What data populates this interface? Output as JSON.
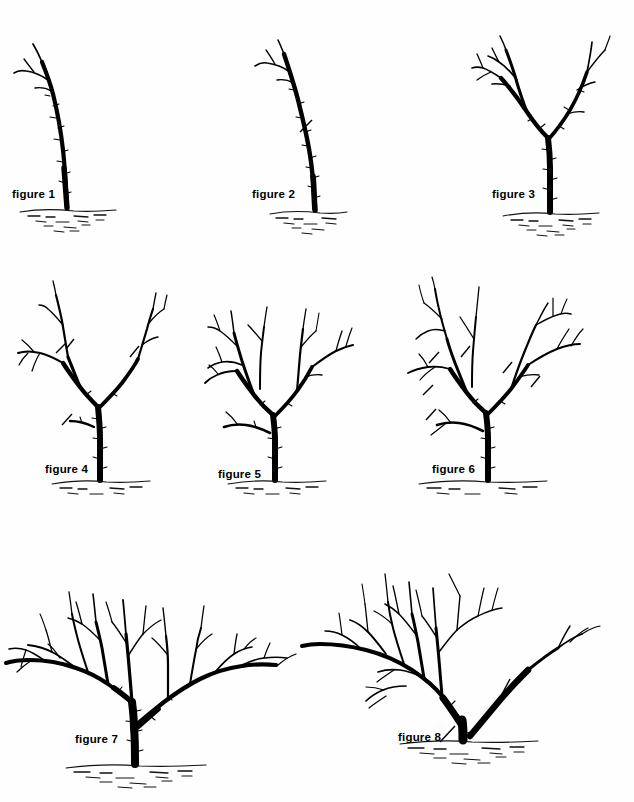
{
  "page": {
    "background_color": "#fefefe",
    "ink_color": "#000000",
    "width": 634,
    "height": 802,
    "row_count": 3,
    "figure_count": 8
  },
  "figures": [
    {
      "id": "figure-1",
      "label": "figure 1",
      "label_x": 12,
      "label_y": 188,
      "panel_x": 8,
      "panel_y": 28,
      "panel_w": 120,
      "panel_h": 210,
      "description": "Unbranched whip: single slightly curved leaning trunk with two small shoots near the top, planted in soil.",
      "stage": "unpruned whip at planting",
      "has_cut_marks": false,
      "cut_mark_count": 0,
      "scaffold_count": 0
    },
    {
      "id": "figure-2",
      "label": "figure 2",
      "label_x": 252,
      "label_y": 188,
      "panel_x": 228,
      "panel_y": 28,
      "panel_w": 120,
      "panel_h": 210,
      "description": "Same whip with a single diagonal heading-cut mark across the trunk part way up, indicating where to head back the leader.",
      "stage": "heading cut marked on whip",
      "has_cut_marks": true,
      "cut_mark_count": 1,
      "scaffold_count": 0
    },
    {
      "id": "figure-3",
      "label": "figure 3",
      "label_x": 492,
      "label_y": 188,
      "panel_x": 455,
      "panel_y": 28,
      "panel_w": 175,
      "panel_h": 210,
      "description": "One season later: trunk with two main scaffold limbs forming a wide V, each carrying several side shoots.",
      "stage": "first season regrowth, two scaffolds",
      "has_cut_marks": false,
      "cut_mark_count": 0,
      "scaffold_count": 2
    },
    {
      "id": "figure-4",
      "label": "figure 4",
      "label_x": 45,
      "label_y": 463,
      "panel_x": 8,
      "panel_y": 275,
      "panel_w": 175,
      "panel_h": 215,
      "description": "Young tree with three scaffold limbs and four diagonal cut marks showing which shoots to head back.",
      "stage": "dormant pruning cuts marked",
      "has_cut_marks": true,
      "cut_mark_count": 4,
      "scaffold_count": 3
    },
    {
      "id": "figure-5",
      "label": "figure 5",
      "label_x": 218,
      "label_y": 468,
      "panel_x": 190,
      "panel_y": 285,
      "panel_w": 175,
      "panel_h": 205,
      "description": "Tree after the cuts of figure 4 have regrown: denser, well balanced head of scaffold branches and laterals.",
      "stage": "second season regrowth",
      "has_cut_marks": false,
      "cut_mark_count": 0,
      "scaffold_count": 4
    },
    {
      "id": "figure-6",
      "label": "figure 6",
      "label_x": 432,
      "label_y": 463,
      "panel_x": 395,
      "panel_y": 275,
      "panel_w": 235,
      "panel_h": 215,
      "description": "Same tree as figure 5 with five diagonal cut marks on crowded and crossing limbs, indicating thinning cuts.",
      "stage": "thinning cuts marked",
      "has_cut_marks": true,
      "cut_mark_count": 5,
      "scaffold_count": 4
    },
    {
      "id": "figure-7",
      "label": "figure 7",
      "label_x": 75,
      "label_y": 733,
      "panel_x": 0,
      "panel_y": 552,
      "panel_w": 300,
      "panel_h": 240,
      "description": "Mature spreading tree with a low open-centre head: heavy scaffolds radiating left and right above a short trunk.",
      "stage": "mature bearing tree",
      "has_cut_marks": false,
      "cut_mark_count": 0,
      "scaffold_count": 5
    },
    {
      "id": "figure-8",
      "label": "figure 8",
      "label_x": 398,
      "label_y": 731,
      "panel_x": 300,
      "panel_y": 548,
      "panel_w": 334,
      "panel_h": 248,
      "description": "Mature tree with one heavy low scaffold marked for removal: a bold bare limb rises to the right with a cut mark at its base and another at the trunk.",
      "stage": "renewal cut of a heavy limb",
      "has_cut_marks": true,
      "cut_mark_count": 2,
      "scaffold_count": 5
    }
  ],
  "legend": {
    "cut_mark_meaning": "short diagonal stroke = location of pruning cut",
    "ground_meaning": "stippled horizontal band = soil line"
  }
}
